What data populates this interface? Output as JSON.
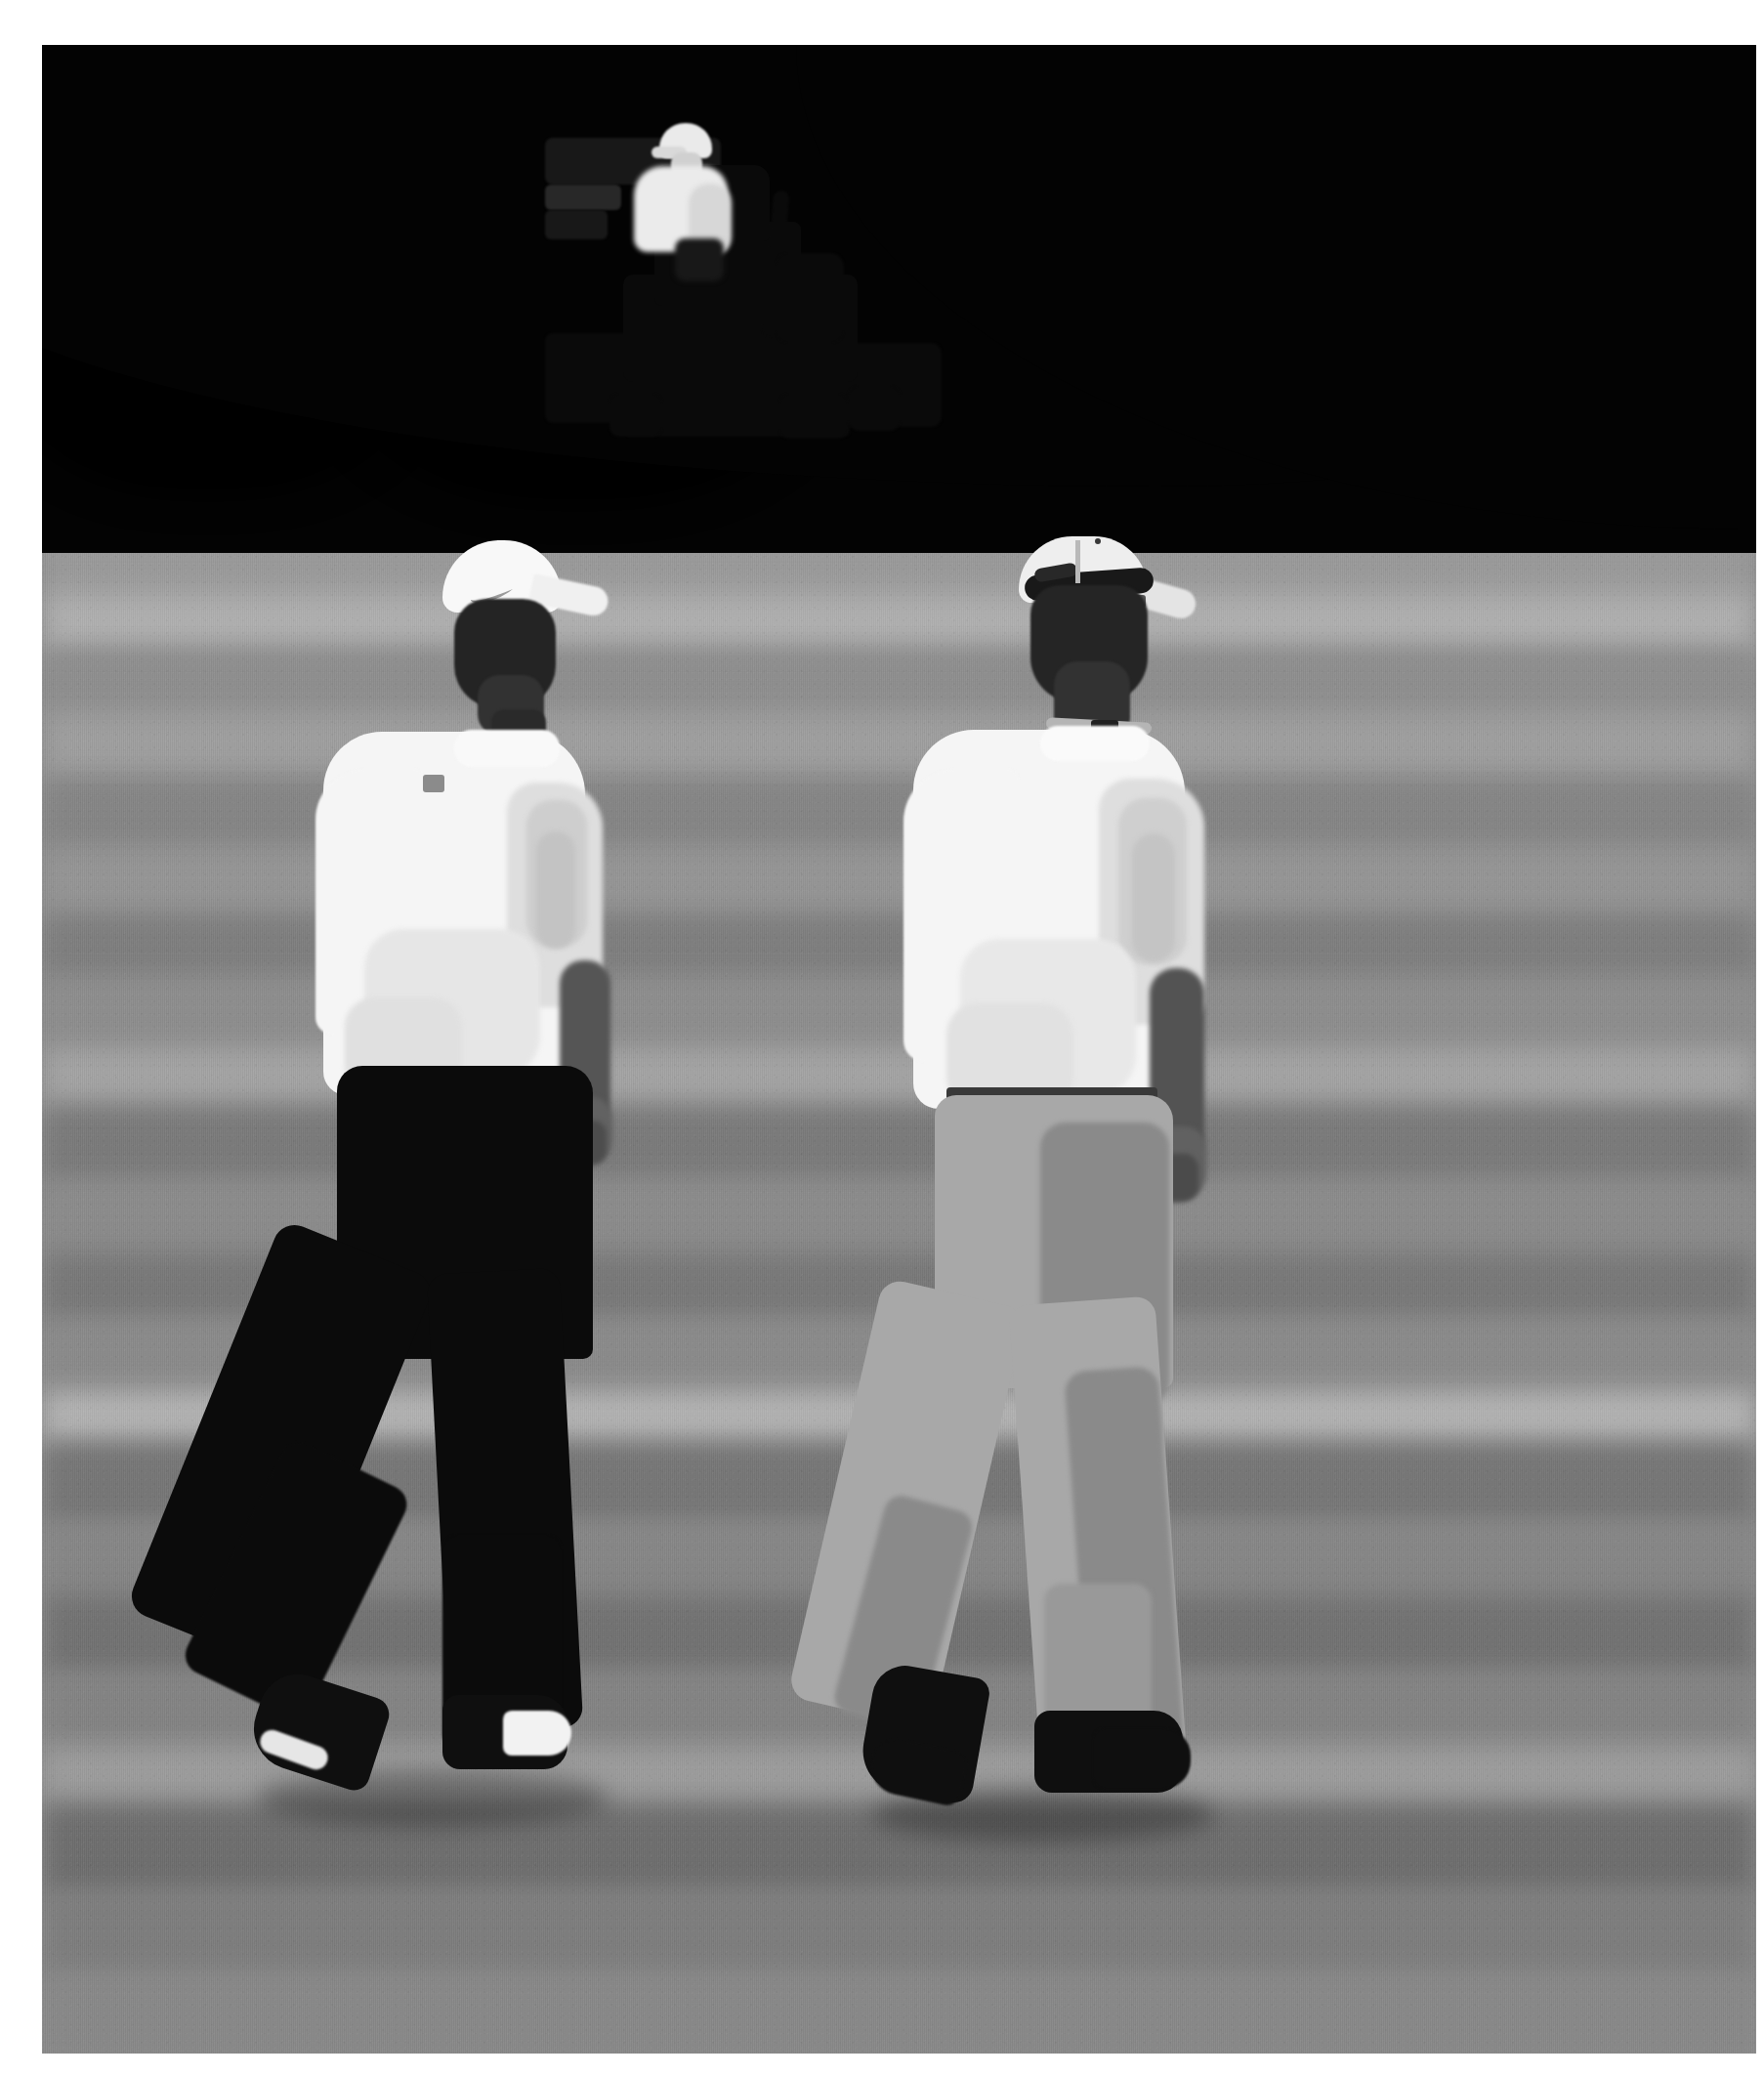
{
  "image": {
    "title": "Two golfers walking on a putting green with a greenskeeper on a mower",
    "medium": "black-and-white photograph",
    "border_color": "#ffffff",
    "orientation": "portrait"
  },
  "palette": {
    "border": "#ffffff",
    "treeline_dark": "#050505",
    "turf_base": "#8d8d8d",
    "turf_light_stripe": "#a9a9a7",
    "turf_dark_stripe": "#6f6f6e",
    "shirt_white": "#f3f3f1",
    "trouser_dark": "#0d0d0d",
    "trouser_light": "#a9a7a0",
    "skin": "#6d6157"
  },
  "scene": {
    "background": {
      "label": "Dark treeline",
      "description": "Deeply shadowed stand of trees forming a black band across the top of the frame, with scattered sunlit leaf highlights on the upper left."
    },
    "ground": {
      "label": "Putting green",
      "description": "Closely mown turf with alternating horizontal light and dark mowing stripes receding toward the horizon."
    },
    "horizon": {
      "label": "Green edge against treeline",
      "description": "Gently curving crest of the green, highest on the left and falling away to the right."
    }
  },
  "subjects": {
    "mower": {
      "label": "Ride-on greens mower",
      "operator_label": "Greenskeeper",
      "operator_clothing": "White short-sleeve shirt and pale cap",
      "machine_color": "dark / black",
      "position": "upper centre-left, on the horizon"
    },
    "player_left": {
      "label": "Golfer (foreground left)",
      "cap": "White cap with Nike swoosh",
      "shirt": "White short-sleeve polo with small dark chest-shoulder logo",
      "trousers": "Black trousers",
      "shoes": "Dark golf shoes with white trim",
      "pose": "Walking left to right, seen from behind, mid-stride"
    },
    "player_right": {
      "label": "Golfer (foreground right)",
      "cap": "Pale cap worn backwards with sunglasses resting on the brim",
      "accessory": "Lanyard around the neck",
      "shirt": "White short-sleeve polo",
      "trousers": "Light grey / khaki pleated trousers with belt",
      "shoes": "Dark golf shoes",
      "pose": "Walking left to right, seen from behind, mid-stride"
    }
  },
  "layout": {
    "frame_inset_left": 43,
    "frame_inset_top": 46,
    "frame_inset_right": 8,
    "frame_inset_bottom": 23,
    "treeline_bottom": 520
  }
}
